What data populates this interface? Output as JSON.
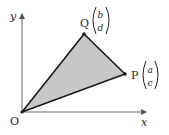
{
  "diagram": {
    "axes": {
      "x_label": "x",
      "y_label": "y",
      "origin_label": "O"
    },
    "points": {
      "O": {
        "label": "O",
        "px": [
          22,
          112
        ]
      },
      "P": {
        "label": "P",
        "vector_top": "a",
        "vector_bottom": "c",
        "px": [
          125,
          74
        ]
      },
      "Q": {
        "label": "Q",
        "vector_top": "b",
        "vector_bottom": "d",
        "px": [
          84,
          34
        ]
      }
    },
    "shape": {
      "type": "triangle",
      "vertices": [
        "O",
        "P",
        "Q"
      ],
      "fill": "#c8c8c8",
      "stroke": "#1a1a1a"
    },
    "colors": {
      "axis": "#555555",
      "text": "#222222"
    }
  }
}
